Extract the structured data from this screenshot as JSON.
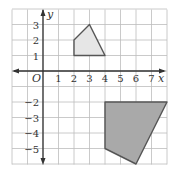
{
  "diagram": {
    "type": "coordinate-grid",
    "x_label": "x",
    "y_label": "y",
    "origin_label": "O",
    "x_range": [
      -2,
      8
    ],
    "y_range": [
      -6,
      4
    ],
    "x_ticks": [
      "1",
      "2",
      "3",
      "4",
      "5",
      "6",
      "7"
    ],
    "y_ticks_positive": [
      "1",
      "2",
      "3"
    ],
    "y_ticks_negative": [
      "−2",
      "−3",
      "−4",
      "−5"
    ],
    "shapes": [
      {
        "name": "light-quadrilateral",
        "fill": "#e6e6e6",
        "stroke": "#555555",
        "vertices": [
          [
            2,
            1
          ],
          [
            2,
            2
          ],
          [
            3,
            3
          ],
          [
            4,
            1
          ]
        ]
      },
      {
        "name": "dark-quadrilateral",
        "fill": "#a9a9a9",
        "stroke": "#555555",
        "vertices": [
          [
            4,
            -2
          ],
          [
            8,
            -2
          ],
          [
            6,
            -6
          ],
          [
            4,
            -5
          ]
        ]
      }
    ],
    "colors": {
      "grid": "#bdbdbd",
      "axis": "#333333"
    }
  }
}
